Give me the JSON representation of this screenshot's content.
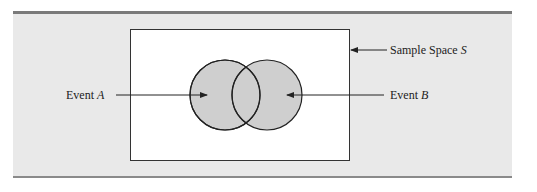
{
  "figure": {
    "sample_space_label": "Sample Space",
    "sample_space_symbol": "S",
    "event_a_label": "Event",
    "event_a_symbol": "A",
    "event_b_label": "Event",
    "event_b_symbol": "B"
  },
  "colors": {
    "band": "#e9e9e9",
    "rule": "#7a7a7a",
    "circle_fill": "#cfcfcf",
    "stroke": "#222222"
  }
}
